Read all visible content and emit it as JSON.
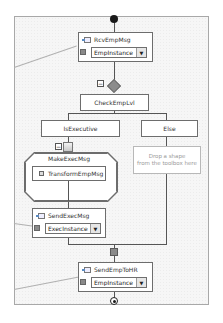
{
  "orchestration": {
    "start_node": "start",
    "end_node": "end",
    "shapes": {
      "receive": {
        "name": "RcvEmpMsg",
        "type": "receive",
        "icon": "receive-message-icon",
        "message": "EmpInstance"
      },
      "decide": {
        "name": "CheckEmpLvl",
        "type": "decide",
        "collapse_symbol": "−",
        "branches": [
          {
            "name": "IsExecutive",
            "shapes": [
              {
                "name": "MakeExecMsg",
                "type": "construct-message",
                "collapse_symbol": "−",
                "inner": {
                  "name": "TransformEmpMsg",
                  "type": "transform",
                  "icon": "transform-icon"
                }
              },
              {
                "name": "SendExecMsg",
                "type": "send",
                "icon": "send-message-icon",
                "message": "ExecInstance"
              }
            ]
          },
          {
            "name": "Else",
            "placeholder_line1": "Drop a shape",
            "placeholder_line2": "from the toolbox here"
          }
        ]
      },
      "send": {
        "name": "SendEmpToHR",
        "type": "send",
        "icon": "send-message-icon",
        "message": "EmpInstance"
      }
    },
    "dropdown_arrow": "▼"
  },
  "colors": {
    "canvas": "#f6f6f6",
    "shape_border": "#6d6d6d",
    "connector": "#555555",
    "port": "#8a8a8a",
    "placeholder_text": "#9a9a9a"
  }
}
